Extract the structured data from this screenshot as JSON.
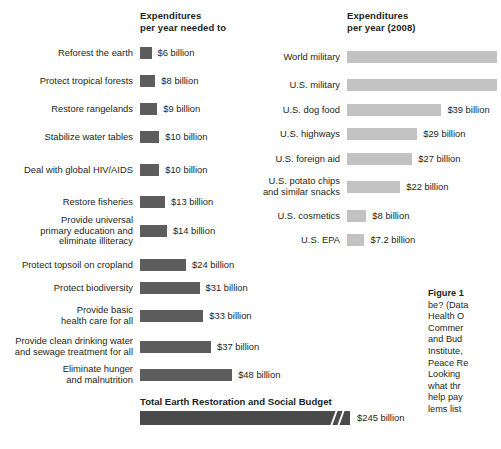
{
  "figure": {
    "headers": {
      "left": "Expenditures\nper year needed to",
      "right": "Expenditures\nper year (2008)"
    },
    "total": {
      "title": "Total Earth Restoration and Social Budget",
      "value_label": "$245 billion",
      "value": 245,
      "has_axis_break": true
    },
    "caption": {
      "head": "Figure 1",
      "lines": [
        "be? (Data",
        "Health O",
        "Commer",
        "and Bud",
        "Institute,",
        "Peace Re",
        "Looking",
        "what thr",
        "help pay",
        "lems list"
      ]
    },
    "colors": {
      "needed_bar": "#5d5d5d",
      "actual_bar": "#c2c2c2",
      "total_bar": "#4a4a4a",
      "text": "#231f20",
      "background": "#ffffff"
    }
  },
  "chart_data": {
    "type": "bar",
    "orientation": "horizontal",
    "xlabel": "",
    "ylabel": "",
    "units": "billions of US dollars per year",
    "grid": false,
    "legend_position": "none",
    "series": [
      {
        "name": "Expenditures per year needed to",
        "color": "#5d5d5d",
        "px_per_unit": 1.92,
        "categories": [
          "Reforest the earth",
          "Protect tropical forests",
          "Restore rangelands",
          "Stabilize water tables",
          "Deal with global HIV/AIDS",
          "Restore fisheries",
          "Provide universal\nprimary education and\neliminate illiteracy",
          "Protect topsoil on cropland",
          "Protect biodiversity",
          "Provide basic\nhealth care for all",
          "Provide clean drinking water\nand sewage treatment for all",
          "Eliminate hunger\nand malnutrition"
        ],
        "values": [
          6,
          8,
          9,
          10,
          10,
          13,
          14,
          24,
          31,
          33,
          37,
          48
        ],
        "labels": [
          "$6 billion",
          "$8 billion",
          "$9 billion",
          "$10 billion",
          "$10 billion",
          "$13 billion",
          "$14 billion",
          "$24 billion",
          "$31 billion",
          "$33 billion",
          "$37 billion",
          "$48 billion"
        ]
      },
      {
        "name": "Expenditures per year (2008)",
        "color": "#c2c2c2",
        "px_per_unit": 2.42,
        "categories": [
          "World military",
          "U.S. military",
          "U.S. dog food",
          "U.S. highways",
          "U.S. foreign aid",
          "U.S. potato chips\nand similar snacks",
          "U.S. cosmetics",
          "U.S. EPA"
        ],
        "values": [
          null,
          null,
          39,
          29,
          27,
          22,
          8,
          7.2
        ],
        "labels": [
          "",
          "",
          "$39 billion",
          "$29 billion",
          "$27 billion",
          "$22 billion",
          "$8 billion",
          "$7.2 billion"
        ],
        "clipped": [
          true,
          true,
          false,
          false,
          false,
          false,
          false,
          false
        ]
      }
    ],
    "total": {
      "label": "Total Earth Restoration and Social Budget",
      "value": 245,
      "value_label": "$245 billion",
      "axis_break": true
    }
  }
}
